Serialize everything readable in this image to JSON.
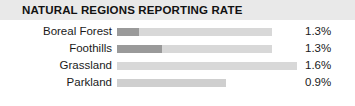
{
  "header": {
    "title": "NATURAL REGIONS REPORTING RATE",
    "band_color": "#e9e9e9"
  },
  "colors": {
    "bar_dark": "#9a9a9a",
    "bar_light": "#d8d8d8",
    "bar_light_alt": "#cfcfcf",
    "text": "#1a1a1a",
    "background": "#ffffff"
  },
  "chart_data": {
    "type": "bar",
    "orientation": "horizontal",
    "title": "NATURAL REGIONS REPORTING RATE",
    "xlabel": "",
    "ylabel": "",
    "grid": false,
    "legend": "none",
    "categories": [
      "Boreal Forest",
      "Foothills",
      "Grassland",
      "Parkland"
    ],
    "values": [
      1.3,
      1.6,
      1.3,
      0.9
    ],
    "value_labels": [
      "1.3%",
      "1.3%",
      "1.6%",
      "0.9%"
    ],
    "bars": [
      {
        "label": "Boreal Forest",
        "value_label": "1.3%",
        "bar_px_width": 155,
        "dark_px_width": 22,
        "light_color": "#d8d8d8",
        "dark_color": "#9a9a9a"
      },
      {
        "label": "Foothills",
        "value_label": "1.3%",
        "bar_px_width": 155,
        "dark_px_width": 45,
        "light_color": "#d8d8d8",
        "dark_color": "#9a9a9a"
      },
      {
        "label": "Grassland",
        "value_label": "1.6%",
        "bar_px_width": 180,
        "dark_px_width": 0,
        "light_color": "#d8d8d8",
        "dark_color": "#d8d8d8"
      },
      {
        "label": "Parkland",
        "value_label": "0.9%",
        "bar_px_width": 109,
        "dark_px_width": 0,
        "light_color": "#cfcfcf",
        "dark_color": "#cfcfcf"
      }
    ]
  }
}
